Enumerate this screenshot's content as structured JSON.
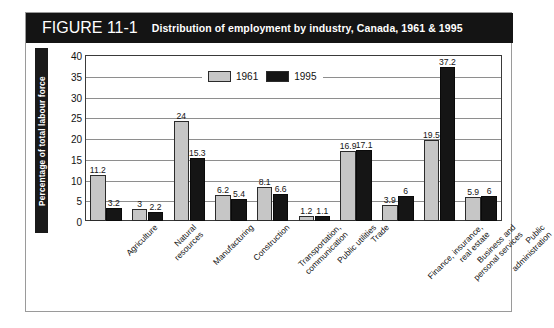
{
  "figure": {
    "number": "FIGURE 11-1",
    "title": "Distribution of employment by industry, Canada, 1961 & 1995"
  },
  "legend": {
    "entries": [
      {
        "label": "1961",
        "color": "#c6c6c6"
      },
      {
        "label": "1995",
        "color": "#151515"
      }
    ]
  },
  "axis": {
    "ylabel": "Percentage of total labour force",
    "yticks": [
      "0",
      "5",
      "10",
      "15",
      "20",
      "25",
      "30",
      "35",
      "40"
    ]
  },
  "chart_data": {
    "type": "bar",
    "title": "Distribution of employment by industry, Canada, 1961 & 1995",
    "xlabel": "",
    "ylabel": "Percentage of total labour force",
    "ylim": [
      0,
      40
    ],
    "ytick_step": 5,
    "grid": true,
    "legend_position": "top-center",
    "categories": [
      "Agriculture",
      "Natural resources",
      "Manufacturing",
      "Construction",
      "Transportation, communication",
      "Public utilities",
      "Trade",
      "Finance, insurance, real estate",
      "Business and personal services",
      "Public administration"
    ],
    "category_label_lines": [
      [
        "Agriculture"
      ],
      [
        "Natural",
        "resources"
      ],
      [
        "Manufacturing"
      ],
      [
        "Construction"
      ],
      [
        "Transportation,",
        "communication"
      ],
      [
        "Public utilities"
      ],
      [
        "Trade"
      ],
      [
        "Finance, insurance,",
        "real estate"
      ],
      [
        "Business and",
        "personal services"
      ],
      [
        "Public",
        "administration"
      ]
    ],
    "series": [
      {
        "name": "1961",
        "color": "#c6c6c6",
        "values": [
          11.2,
          3,
          24,
          6.2,
          8.1,
          1.2,
          16.9,
          3.9,
          19.5,
          5.9
        ],
        "value_labels": [
          "11.2",
          "3",
          "24",
          "6.2",
          "8.1",
          "1.2",
          "16.9",
          "3.9",
          "19.5",
          "5.9"
        ]
      },
      {
        "name": "1995",
        "color": "#151515",
        "values": [
          3.2,
          2.2,
          15.3,
          5.4,
          6.6,
          1.1,
          17.1,
          6,
          37.2,
          6
        ],
        "value_labels": [
          "3.2",
          "2.2",
          "15.3",
          "5.4",
          "6.6",
          "1.1",
          "17.1",
          "6",
          "37.2",
          "6"
        ]
      }
    ]
  }
}
